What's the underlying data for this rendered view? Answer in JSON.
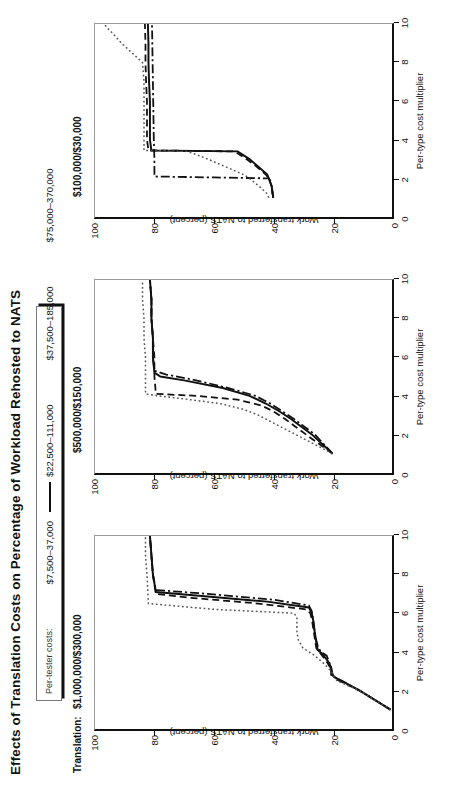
{
  "title": "Effects of Translation Costs on Percentage of Workload Rehosted to NATS",
  "legend": {
    "label": "Per-tester costs:",
    "items": [
      {
        "name": "$7,500–37,000",
        "style": "dashdot"
      },
      {
        "name": "$22,500–111,000",
        "style": "long"
      },
      {
        "name": "$37,500–185,000",
        "style": "dash"
      },
      {
        "name": "$75,000–370,000",
        "style": "dot"
      }
    ]
  },
  "panel_prefix": "Translation:",
  "axes": {
    "xlabel": "Per-type cost multiplier",
    "ylabel": "Work transferred to NATS (percent)",
    "xticks": [
      0,
      2,
      4,
      6,
      8,
      10
    ],
    "yticks": [
      0,
      20,
      40,
      60,
      80,
      100
    ],
    "xlim": [
      0,
      10
    ],
    "ylim": [
      0,
      100
    ]
  },
  "chart_data": [
    {
      "type": "line",
      "title": "$1,000,000/$300,000",
      "xlabel": "Per-type cost multiplier",
      "ylabel": "Work transferred to NATS (percent)",
      "xlim": [
        0,
        10
      ],
      "ylim": [
        0,
        100
      ],
      "xticks": [
        0,
        2,
        4,
        6,
        8,
        10
      ],
      "yticks": [
        0,
        20,
        40,
        60,
        80,
        100
      ],
      "grid": false,
      "legend_position": "top",
      "series": [
        {
          "name": "$7,500–37,000",
          "style": "dashdot",
          "x": [
            1.0,
            2.0,
            2.75,
            2.8,
            3.2,
            3.4,
            3.8,
            4.0,
            4.3,
            4.6,
            5.0,
            5.6,
            6.1,
            6.4,
            6.7,
            7.0,
            7.2,
            8.0,
            9.0,
            10.0
          ],
          "y": [
            0.5,
            11.0,
            20.0,
            20.5,
            20.5,
            21.0,
            22.0,
            24.0,
            25.0,
            25.5,
            26.0,
            26.5,
            27.0,
            28.0,
            40.0,
            62.0,
            79.5,
            80.5,
            81.0,
            81.5
          ]
        },
        {
          "name": "$22,500–111,000",
          "style": "long",
          "x": [
            1.0,
            2.0,
            2.7,
            2.8,
            3.2,
            3.5,
            3.9,
            4.1,
            4.5,
            5.0,
            5.6,
            6.0,
            6.3,
            6.6,
            6.9,
            7.1,
            8.0,
            9.0,
            10.0
          ],
          "y": [
            0.5,
            11.0,
            19.5,
            20.0,
            20.5,
            21.5,
            23.5,
            25.0,
            25.5,
            26.0,
            26.5,
            27.0,
            28.0,
            42.0,
            65.0,
            79.5,
            80.5,
            81.0,
            81.5
          ]
        },
        {
          "name": "$37,500–185,000",
          "style": "dash",
          "x": [
            1.0,
            2.0,
            2.6,
            2.8,
            3.1,
            3.5,
            3.9,
            4.2,
            4.7,
            5.2,
            5.7,
            6.0,
            6.2,
            6.5,
            6.8,
            7.0,
            8.0,
            9.0,
            10.0
          ],
          "y": [
            0.5,
            11.0,
            19.0,
            20.0,
            20.5,
            22.0,
            24.0,
            25.5,
            26.0,
            26.5,
            27.0,
            27.5,
            29.0,
            45.0,
            68.0,
            79.5,
            80.5,
            81.0,
            81.5
          ]
        },
        {
          "name": "$75,000–370,000",
          "style": "dot",
          "x": [
            1.0,
            2.0,
            2.5,
            2.7,
            3.0,
            3.4,
            3.8,
            4.2,
            4.6,
            5.0,
            5.4,
            5.8,
            6.0,
            6.2,
            6.5,
            8.0,
            9.0,
            10.0
          ],
          "y": [
            0.5,
            11.0,
            18.5,
            19.5,
            20.5,
            23.0,
            26.0,
            30.0,
            31.5,
            32.0,
            32.0,
            32.0,
            33.0,
            60.0,
            82.0,
            82.5,
            83.0,
            83.0
          ]
        }
      ]
    },
    {
      "type": "line",
      "title": "$500,000/$150,000",
      "xlabel": "Per-type cost multiplier",
      "ylabel": "Work transferred to NATS (percent)",
      "xlim": [
        0,
        10
      ],
      "ylim": [
        0,
        100
      ],
      "xticks": [
        0,
        2,
        4,
        6,
        8,
        10
      ],
      "yticks": [
        0,
        20,
        40,
        60,
        80,
        100
      ],
      "grid": false,
      "legend_position": "top",
      "series": [
        {
          "name": "$7,500–37,000",
          "style": "dashdot",
          "x": [
            1.0,
            1.5,
            2.0,
            2.4,
            2.8,
            3.2,
            3.6,
            4.0,
            4.4,
            4.8,
            5.1,
            5.3,
            6.0,
            7.0,
            8.0,
            9.0,
            10.0
          ],
          "y": [
            20.0,
            23.0,
            26.0,
            29.5,
            33.0,
            37.0,
            41.0,
            46.0,
            55.0,
            66.0,
            76.0,
            80.0,
            80.5,
            80.5,
            81.0,
            81.0,
            81.5
          ]
        },
        {
          "name": "$22,500–111,000",
          "style": "long",
          "x": [
            1.0,
            1.5,
            2.0,
            2.4,
            2.8,
            3.2,
            3.6,
            4.0,
            4.4,
            4.8,
            5.0,
            5.2,
            6.0,
            7.0,
            8.0,
            9.0,
            10.0
          ],
          "y": [
            20.0,
            23.5,
            27.0,
            30.5,
            34.0,
            38.0,
            42.5,
            48.0,
            57.0,
            70.0,
            78.0,
            80.0,
            80.5,
            80.5,
            81.0,
            81.0,
            81.5
          ]
        },
        {
          "name": "$37,500–185,000",
          "style": "dash",
          "x": [
            1.0,
            1.5,
            2.0,
            2.4,
            2.8,
            3.2,
            3.5,
            3.8,
            4.0,
            4.1,
            5.0,
            6.0,
            7.0,
            8.0,
            9.0,
            10.0
          ],
          "y": [
            20.0,
            24.5,
            29.0,
            32.5,
            36.0,
            40.0,
            44.0,
            52.0,
            66.0,
            79.5,
            80.0,
            80.0,
            80.5,
            81.0,
            81.0,
            81.5
          ]
        },
        {
          "name": "$75,000–370,000",
          "style": "dot",
          "x": [
            1.0,
            1.4,
            1.8,
            2.2,
            2.6,
            3.0,
            3.3,
            3.6,
            3.8,
            4.0,
            4.1,
            5.0,
            6.0,
            7.0,
            8.0,
            9.0,
            10.0
          ],
          "y": [
            20.0,
            25.0,
            30.0,
            35.0,
            40.0,
            45.0,
            50.0,
            58.0,
            68.0,
            79.0,
            83.0,
            83.0,
            83.0,
            83.5,
            83.5,
            84.0,
            84.0
          ]
        }
      ]
    },
    {
      "type": "line",
      "title": "$100,000/$30,000",
      "xlabel": "Per-type cost multiplier",
      "ylabel": "Work transferred to NATS (percent)",
      "xlim": [
        0,
        10
      ],
      "ylim": [
        0,
        100
      ],
      "xticks": [
        0,
        2,
        4,
        6,
        8,
        10
      ],
      "yticks": [
        0,
        20,
        40,
        60,
        80,
        100
      ],
      "grid": false,
      "legend_position": "top",
      "series": [
        {
          "name": "$7,500–37,000",
          "style": "dashdot",
          "x": [
            1.0,
            1.5,
            1.9,
            2.0,
            2.05,
            2.1,
            3.0,
            4.0,
            5.0,
            6.0,
            7.0,
            8.0,
            9.0,
            10.0
          ],
          "y": [
            40.0,
            40.5,
            41.0,
            41.5,
            60.0,
            80.0,
            80.0,
            80.2,
            80.3,
            80.4,
            80.5,
            80.6,
            80.7,
            80.8
          ]
        },
        {
          "name": "$22,500–111,000",
          "style": "long",
          "x": [
            1.0,
            1.6,
            2.0,
            2.2,
            2.6,
            3.0,
            3.3,
            3.4,
            3.45,
            4.0,
            5.0,
            6.0,
            7.0,
            8.0,
            9.0,
            10.0
          ],
          "y": [
            40.0,
            40.5,
            41.5,
            42.0,
            45.0,
            48.0,
            51.0,
            52.0,
            81.0,
            81.5,
            81.5,
            81.5,
            81.8,
            82.0,
            82.0,
            82.2
          ]
        },
        {
          "name": "$37,500–185,000",
          "style": "dash",
          "x": [
            1.0,
            1.6,
            2.0,
            2.2,
            2.6,
            3.0,
            3.3,
            3.4,
            3.45,
            4.0,
            5.0,
            6.0,
            7.0,
            8.0,
            9.0,
            10.0
          ],
          "y": [
            40.0,
            40.5,
            41.5,
            42.5,
            45.5,
            49.0,
            52.0,
            53.0,
            82.0,
            82.5,
            82.5,
            82.5,
            82.8,
            83.0,
            83.0,
            83.2
          ]
        },
        {
          "name": "$75,000–370,000",
          "style": "dot",
          "x": [
            1.0,
            1.2,
            1.5,
            2.0,
            2.2,
            2.6,
            3.0,
            3.3,
            3.4,
            3.45,
            4.0,
            5.0,
            6.0,
            7.0,
            8.0,
            9.0,
            10.0
          ],
          "y": [
            41.5,
            42.0,
            44.0,
            48.0,
            50.0,
            56.0,
            62.0,
            67.0,
            69.0,
            83.5,
            83.5,
            83.5,
            83.5,
            83.5,
            84.0,
            91.0,
            97.0
          ]
        }
      ]
    }
  ]
}
